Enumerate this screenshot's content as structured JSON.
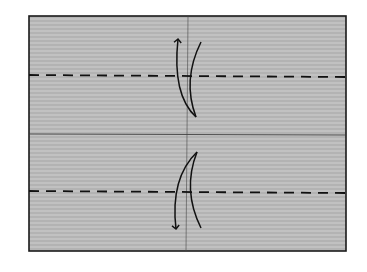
{
  "diagram": {
    "type": "origami-fold-step",
    "paper": {
      "x": 29,
      "y": 16,
      "width": 317,
      "height": 235,
      "fill": "#b9b9b9",
      "grain_color": "#a4a4a4",
      "border_color": "#1a1a1a"
    },
    "creases": [
      {
        "kind": "existing-crease",
        "orientation": "horizontal",
        "y": 134
      },
      {
        "kind": "existing-crease",
        "orientation": "vertical",
        "x": 187
      }
    ],
    "valley_folds": [
      {
        "label": "top-valley-fold",
        "y": 75
      },
      {
        "label": "bottom-valley-fold",
        "y": 192
      }
    ],
    "arrows": [
      {
        "label": "fold-unfold-arrow-top",
        "direction": "up",
        "near_fold": "top-valley-fold"
      },
      {
        "label": "fold-unfold-arrow-bottom",
        "direction": "down",
        "near_fold": "bottom-valley-fold"
      }
    ],
    "line_color": "#111111"
  }
}
